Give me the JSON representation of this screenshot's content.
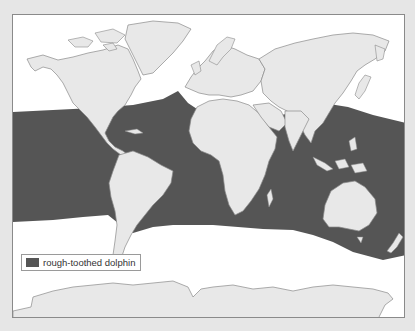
{
  "map": {
    "title": "Rough-toothed dolphin range map",
    "colors": {
      "background": "#e6e6e6",
      "ocean": "#ffffff",
      "land": "#e8e8e8",
      "border": "#8a8a8a",
      "range": "#555555"
    },
    "legend": {
      "items": [
        {
          "label": "rough-toothed dolphin",
          "color": "#555555"
        }
      ]
    },
    "regions": [
      "North America",
      "Greenland",
      "South America",
      "Europe",
      "Africa",
      "Asia",
      "Arabian Peninsula",
      "India",
      "Southeast Asia",
      "Australia",
      "New Zealand",
      "Antarctica"
    ],
    "range_description": "Tropical and warm-temperate waters of the Atlantic, Pacific and Indian Oceans including the Mediterranean Sea, Gulf of Mexico and Caribbean"
  }
}
